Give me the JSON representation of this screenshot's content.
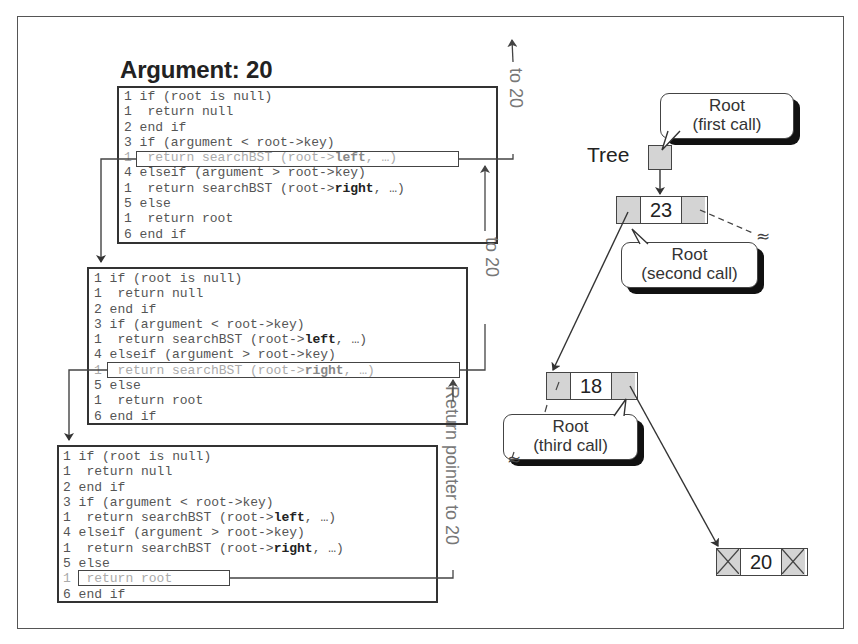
{
  "title": "Argument: 20",
  "code_lines": [
    {
      "num": "1",
      "indent": false,
      "text": "if (root is null)"
    },
    {
      "num": "1",
      "indent": true,
      "text": "return null"
    },
    {
      "num": "2",
      "indent": false,
      "text": "end if"
    },
    {
      "num": "3",
      "indent": false,
      "text": "if (argument < root->key)"
    },
    {
      "num": "1",
      "indent": true,
      "text": "return searchBST (root->",
      "bold": "left",
      "tail": ", …)"
    },
    {
      "num": "4",
      "indent": false,
      "text": "elseif (argument > root->key)"
    },
    {
      "num": "1",
      "indent": true,
      "text": "return searchBST (root->",
      "bold": "right",
      "tail": ", …)"
    },
    {
      "num": "5",
      "indent": false,
      "text": "else"
    },
    {
      "num": "1",
      "indent": true,
      "text": "return root"
    },
    {
      "num": "6",
      "indent": false,
      "text": "end if"
    }
  ],
  "calls": [
    {
      "name": "first-call",
      "highlight_line": 4,
      "return_label": "to 20"
    },
    {
      "name": "second-call",
      "highlight_line": 6,
      "return_label": "to 20"
    },
    {
      "name": "third-call",
      "highlight_line": 8,
      "return_label": "Return pointer to 20"
    }
  ],
  "tree": {
    "label": "Tree",
    "nodes": [
      {
        "key": "23",
        "left": "pointer",
        "right": "pointer"
      },
      {
        "key": "18",
        "left": "null-slash",
        "right": "pointer"
      },
      {
        "key": "20",
        "left": "null",
        "right": "null"
      }
    ],
    "bubbles": [
      {
        "line1": "Root",
        "line2": "(first call)"
      },
      {
        "line1": "Root",
        "line2": "(second call)"
      },
      {
        "line1": "Root",
        "line2": "(third call)"
      }
    ],
    "break_symbol": "≈"
  },
  "colors": {
    "box_border": "#333333",
    "node_fill": "#d4d4d4",
    "text_dim": "#aaaaaa",
    "text_code": "#555555",
    "shadow": "#111111"
  }
}
